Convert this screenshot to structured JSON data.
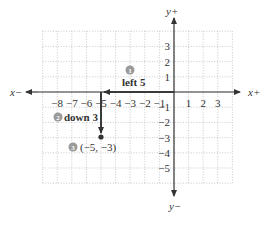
{
  "diagram": {
    "type": "coordinate-plane",
    "axes": {
      "x_pos_label": "x+",
      "x_neg_label": "x−",
      "y_pos_label": "y+",
      "y_neg_label": "y−",
      "x_ticks": [
        {
          "value": -8,
          "label": "−8"
        },
        {
          "value": -7,
          "label": "−7"
        },
        {
          "value": -6,
          "label": "−6"
        },
        {
          "value": -5,
          "label": "−5"
        },
        {
          "value": -4,
          "label": "−4"
        },
        {
          "value": -3,
          "label": "−3"
        },
        {
          "value": -2,
          "label": "−2"
        },
        {
          "value": -1,
          "label": "−1"
        },
        {
          "value": 1,
          "label": "1"
        },
        {
          "value": 2,
          "label": "2"
        },
        {
          "value": 3,
          "label": "3"
        }
      ],
      "y_ticks": [
        {
          "value": 3,
          "label": "3"
        },
        {
          "value": 2,
          "label": "2"
        },
        {
          "value": 1,
          "label": "1"
        },
        {
          "value": -1,
          "label": "−1"
        },
        {
          "value": -2,
          "label": "−2"
        },
        {
          "value": -3,
          "label": "−3"
        },
        {
          "value": -4,
          "label": "−4"
        },
        {
          "value": -5,
          "label": "−5"
        }
      ],
      "grid": {
        "x_min": -9,
        "x_max": 4,
        "y_min": -6,
        "y_max": 4,
        "style": "dotted"
      }
    },
    "steps": [
      {
        "number": "1",
        "text": "left 5"
      },
      {
        "number": "2",
        "text": "down 3"
      },
      {
        "number": "3",
        "text": "(−5, −3)"
      }
    ],
    "point": {
      "x": -5,
      "y": -3,
      "label": "(−5, −3)"
    },
    "colors": {
      "axis": "#333333",
      "arrow": "#3a3a3a",
      "grid": "#bdbdbd",
      "badge": "#9a9a9a",
      "text": "#333333"
    }
  }
}
